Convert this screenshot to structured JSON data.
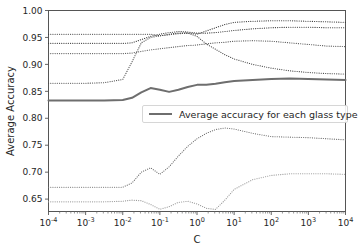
{
  "chart_data": {
    "type": "line",
    "title": "",
    "xlabel": "C",
    "ylabel": "Average Accuracy",
    "xscale": "log",
    "xlim": [
      0.0001,
      10000
    ],
    "ylim": [
      0.627,
      1.0
    ],
    "yticks": [
      "0.65",
      "0.70",
      "0.75",
      "0.80",
      "0.85",
      "0.90",
      "0.95",
      "1.00"
    ],
    "ytick_values": [
      0.65,
      0.7,
      0.75,
      0.8,
      0.85,
      0.9,
      0.95,
      1.0
    ],
    "xticks": [
      "10−4",
      "10−3",
      "10−2",
      "10−1",
      "10⁰",
      "10¹",
      "10²",
      "10³",
      "10⁴"
    ],
    "xtick_values": [
      0.0001,
      0.001,
      0.01,
      0.1,
      1,
      10,
      100,
      1000,
      10000
    ],
    "xtick_mantissa": [
      "10",
      "10",
      "10",
      "10",
      "10",
      "10",
      "10",
      "10",
      "10"
    ],
    "xtick_exponent": [
      "-4",
      "-3",
      "-2",
      "-1",
      "0",
      "1",
      "2",
      "3",
      "4"
    ],
    "grid": false,
    "legend_position": "center-right",
    "legend_entries": [
      {
        "label": "Average accuracy for each glass type",
        "style": "solid",
        "color": "#6e6e6e",
        "width": 2.0
      }
    ],
    "x": [
      0.0001,
      0.000316,
      0.001,
      0.00316,
      0.01,
      0.0178,
      0.0316,
      0.0562,
      0.1,
      0.178,
      0.316,
      0.562,
      1,
      1.78,
      3.16,
      5.62,
      10,
      31.6,
      100,
      316,
      1000,
      3160,
      10000
    ],
    "series": [
      {
        "name": "glass-type-1",
        "style": "dotted",
        "color": "#3a3a3a",
        "values": [
          0.956,
          0.956,
          0.956,
          0.956,
          0.956,
          0.956,
          0.956,
          0.956,
          0.953,
          0.956,
          0.958,
          0.958,
          0.956,
          0.962,
          0.968,
          0.974,
          0.978,
          0.98,
          0.981,
          0.981,
          0.98,
          0.979,
          0.978
        ]
      },
      {
        "name": "glass-type-2",
        "style": "dotted",
        "color": "#3a3a3a",
        "values": [
          0.939,
          0.939,
          0.939,
          0.939,
          0.939,
          0.94,
          0.946,
          0.952,
          0.956,
          0.959,
          0.961,
          0.96,
          0.958,
          0.958,
          0.959,
          0.961,
          0.963,
          0.966,
          0.968,
          0.969,
          0.969,
          0.968,
          0.968
        ]
      },
      {
        "name": "glass-type-3",
        "style": "dotted",
        "color": "#5a5a5a",
        "values": [
          0.92,
          0.92,
          0.92,
          0.92,
          0.92,
          0.921,
          0.924,
          0.927,
          0.929,
          0.931,
          0.933,
          0.935,
          0.936,
          0.938,
          0.94,
          0.941,
          0.943,
          0.944,
          0.943,
          0.94,
          0.937,
          0.934,
          0.933
        ]
      },
      {
        "name": "glass-type-4",
        "style": "dotted",
        "color": "#4a4a4a",
        "values": [
          0.865,
          0.865,
          0.865,
          0.866,
          0.872,
          0.905,
          0.94,
          0.95,
          0.953,
          0.955,
          0.957,
          0.958,
          0.952,
          0.938,
          0.928,
          0.918,
          0.91,
          0.9,
          0.893,
          0.888,
          0.885,
          0.883,
          0.882
        ]
      },
      {
        "name": "glass-type-5",
        "style": "dotted",
        "color": "#707070",
        "values": [
          0.672,
          0.672,
          0.672,
          0.672,
          0.672,
          0.68,
          0.7,
          0.708,
          0.696,
          0.71,
          0.73,
          0.748,
          0.762,
          0.772,
          0.779,
          0.782,
          0.78,
          0.772,
          0.766,
          0.765,
          0.764,
          0.762,
          0.76
        ]
      },
      {
        "name": "glass-type-6",
        "style": "dotted",
        "color": "#9a9a9a",
        "values": [
          0.645,
          0.645,
          0.645,
          0.645,
          0.646,
          0.648,
          0.647,
          0.64,
          0.631,
          0.636,
          0.644,
          0.646,
          0.641,
          0.633,
          0.631,
          0.648,
          0.668,
          0.686,
          0.694,
          0.697,
          0.697,
          0.697,
          0.696
        ]
      },
      {
        "name": "Average accuracy for each glass type",
        "style": "solid",
        "color": "#6e6e6e",
        "width": 2.0,
        "values": [
          0.833,
          0.833,
          0.833,
          0.833,
          0.834,
          0.838,
          0.848,
          0.856,
          0.853,
          0.849,
          0.853,
          0.858,
          0.862,
          0.862,
          0.864,
          0.867,
          0.869,
          0.871,
          0.873,
          0.874,
          0.873,
          0.872,
          0.871
        ]
      }
    ]
  },
  "axes": {
    "y_label": "Average Accuracy",
    "x_label": "C"
  }
}
